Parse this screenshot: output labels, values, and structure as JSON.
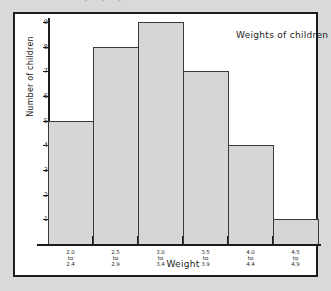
{
  "page": {
    "background_color": "#d9d9d9",
    "clipped_header_fragment": ". . ."
  },
  "chart_data": {
    "type": "bar",
    "title": "Weights of children",
    "xlabel": "Weight",
    "ylabel": "Number of children",
    "categories": [
      "2.0 to 2.4",
      "2.5 to 2.9",
      "3.0 to 3.4",
      "3.5 to 3.9",
      "4.0 to 4.4",
      "4.5 to 4.9"
    ],
    "category_lines": [
      [
        "2.0",
        "to",
        "2.4"
      ],
      [
        "2.5",
        "to",
        "2.9"
      ],
      [
        "3.0",
        "to",
        "3.4"
      ],
      [
        "3.5",
        "to",
        "3.9"
      ],
      [
        "4.0",
        "to",
        "4.4"
      ],
      [
        "4.5",
        "to",
        "4.9"
      ]
    ],
    "values": [
      5,
      8,
      9,
      7,
      4,
      1
    ],
    "ylim": [
      0,
      9
    ],
    "yticks": [
      1,
      2,
      3,
      4,
      5,
      6,
      7,
      8,
      9
    ],
    "grid": false,
    "legend": "none",
    "bar_fill_color": "#d6d6d6",
    "bar_edge_color": "#3a3a3a",
    "axis_color": "#1c1c1c"
  }
}
